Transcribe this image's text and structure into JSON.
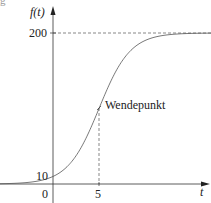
{
  "cut_text": "g          ",
  "chart_data": {
    "type": "line",
    "title": "",
    "xlabel": "t",
    "ylabel": "f(t)",
    "function": "logistic f(t) = 200 / (1 + 19 e^(-k t)), k ≈ 0.589",
    "x_ticks": [
      "0",
      "5"
    ],
    "y_ticks": [
      "10",
      "200"
    ],
    "asymptote": 200,
    "initial_value": 10,
    "inflection_point": {
      "t": 5,
      "f": 100,
      "label": "Wendepunkt"
    },
    "x": [
      -6,
      -4,
      -2,
      0,
      2,
      4,
      5,
      6,
      8,
      10,
      12,
      14,
      16
    ],
    "values": [
      0.3,
      1.0,
      3.2,
      10,
      28.6,
      67.3,
      100,
      132.7,
      171.4,
      190,
      196.8,
      199.0,
      199.7
    ],
    "xlim": [
      -6,
      17
    ],
    "ylim": [
      0,
      200
    ],
    "grid": false,
    "dashed_guides": [
      "y=200 asymptote",
      "t=5 vertical to inflection point"
    ]
  },
  "labels": {
    "ylabel": "f(t)",
    "xlabel": "t",
    "y200": "200",
    "y10": "10",
    "x0": "0",
    "x5": "5",
    "inflection": "Wendepunkt"
  }
}
